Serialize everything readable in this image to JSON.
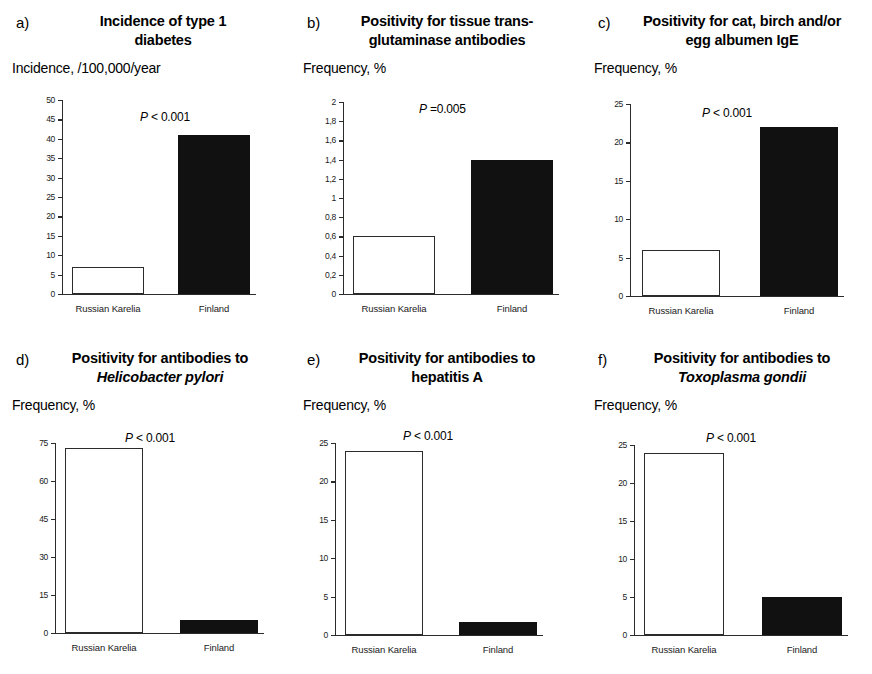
{
  "figure": {
    "background": "#ffffff",
    "bar_open_color": "#ffffff",
    "bar_filled_color": "#111111",
    "axis_color": "#2b2b2b"
  },
  "chart_data": [
    {
      "type": "bar",
      "panel": "a)",
      "title": "Incidence of type 1 diabetes",
      "title_lines": [
        "Incidence of type 1",
        "diabetes"
      ],
      "ylabel": "Incidence, /100,000/year",
      "xlabel": "",
      "categories": [
        "Russian Karelia",
        "Finland"
      ],
      "values": [
        7,
        41
      ],
      "ylim": [
        0,
        50
      ],
      "yticks": [
        0,
        5,
        10,
        15,
        20,
        25,
        30,
        35,
        40,
        45,
        50
      ],
      "ytick_labels": [
        "0",
        "5",
        "10",
        "15",
        "20",
        "25",
        "30",
        "35",
        "40",
        "45",
        "50"
      ],
      "annotation": "P < 0.001",
      "annotation_symbol": "P",
      "annotation_rest": " < 0.001",
      "grid": false,
      "legend": "none",
      "bar_styles": [
        "open",
        "filled"
      ]
    },
    {
      "type": "bar",
      "panel": "b)",
      "title": "Positivity for tissue trans-glutaminase antibodies",
      "title_lines": [
        "Positivity for tissue trans-",
        "glutaminase antibodies"
      ],
      "ylabel": "Frequency, %",
      "xlabel": "",
      "categories": [
        "Russian Karelia",
        "Finland"
      ],
      "values": [
        0.6,
        1.4
      ],
      "ylim": [
        0,
        2
      ],
      "yticks": [
        0,
        0.2,
        0.4,
        0.6,
        0.8,
        1,
        1.2,
        1.4,
        1.6,
        1.8,
        2
      ],
      "ytick_labels": [
        "0",
        "0,2",
        "0,4",
        "0,6",
        "0,8",
        "1",
        "1,2",
        "1,4",
        "1,6",
        "1,8",
        "2"
      ],
      "annotation": "P =0.005",
      "annotation_symbol": "P",
      "annotation_rest": " =0.005",
      "grid": false,
      "legend": "none",
      "bar_styles": [
        "open",
        "filled"
      ]
    },
    {
      "type": "bar",
      "panel": "c)",
      "title": "Positivity for cat, birch and/or egg albumen IgE",
      "title_lines": [
        "Positivity for cat, birch and/or",
        "egg albumen IgE"
      ],
      "ylabel": "Frequency, %",
      "xlabel": "",
      "categories": [
        "Russian Karelia",
        "Finland"
      ],
      "values": [
        6,
        22
      ],
      "ylim": [
        0,
        25
      ],
      "yticks": [
        0,
        5,
        10,
        15,
        20,
        25
      ],
      "ytick_labels": [
        "0",
        "5",
        "10",
        "15",
        "20",
        "25"
      ],
      "annotation": "P < 0.001",
      "annotation_symbol": "P",
      "annotation_rest": " < 0.001",
      "grid": false,
      "legend": "none",
      "bar_styles": [
        "open",
        "filled"
      ]
    },
    {
      "type": "bar",
      "panel": "d)",
      "title": "Positivity for antibodies to Helicobacter pylori",
      "title_lines": [
        "Positivity for antibodies to",
        "Helicobacter pylori"
      ],
      "title_italic_line": 1,
      "ylabel": "Frequency, %",
      "xlabel": "",
      "categories": [
        "Russian Karelia",
        "Finland"
      ],
      "values": [
        73,
        5
      ],
      "ylim": [
        0,
        75
      ],
      "yticks": [
        0,
        15,
        30,
        45,
        60,
        75
      ],
      "ytick_labels": [
        "0",
        "15",
        "30",
        "45",
        "60",
        "75"
      ],
      "annotation": "P < 0.001",
      "annotation_symbol": "P",
      "annotation_rest": " < 0.001",
      "grid": false,
      "legend": "none",
      "bar_styles": [
        "open",
        "filled"
      ]
    },
    {
      "type": "bar",
      "panel": "e)",
      "title": "Positivity for antibodies to hepatitis A",
      "title_lines": [
        "Positivity for antibodies to",
        "hepatitis A"
      ],
      "ylabel": "Frequency, %",
      "xlabel": "",
      "categories": [
        "Russian Karelia",
        "Finland"
      ],
      "values": [
        24,
        1.7
      ],
      "ylim": [
        0,
        25
      ],
      "yticks": [
        0,
        5,
        10,
        15,
        20,
        25
      ],
      "ytick_labels": [
        "0",
        "5",
        "10",
        "15",
        "20",
        "25"
      ],
      "annotation": "P < 0.001",
      "annotation_symbol": "P",
      "annotation_rest": " < 0.001",
      "grid": false,
      "legend": "none",
      "bar_styles": [
        "open",
        "filled"
      ]
    },
    {
      "type": "bar",
      "panel": "f)",
      "title": "Positivity for antibodies to Toxoplasma gondii",
      "title_lines": [
        "Positivity for antibodies to",
        "Toxoplasma gondii"
      ],
      "title_italic_line": 1,
      "ylabel": "Frequency, %",
      "xlabel": "",
      "categories": [
        "Russian Karelia",
        "Finland"
      ],
      "values": [
        24,
        5
      ],
      "ylim": [
        0,
        25
      ],
      "yticks": [
        0,
        5,
        10,
        15,
        20,
        25
      ],
      "ytick_labels": [
        "0",
        "5",
        "10",
        "15",
        "20",
        "25"
      ],
      "annotation": "P < 0.001",
      "annotation_symbol": "P",
      "annotation_rest": " < 0.001",
      "grid": false,
      "legend": "none",
      "bar_styles": [
        "open",
        "filled"
      ]
    }
  ]
}
